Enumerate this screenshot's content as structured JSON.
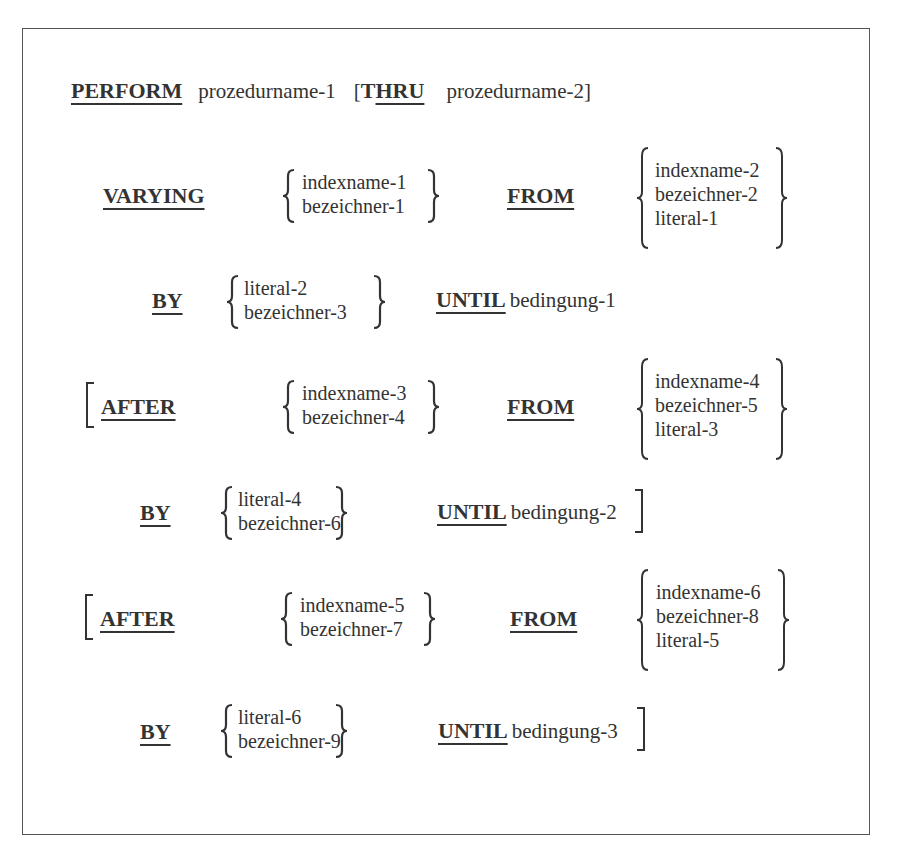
{
  "document": {
    "title": "COBOL PERFORM VARYING syntax format",
    "line1": {
      "keyword": "PERFORM",
      "operand1": "prozedurname-1",
      "open_bracket": "[",
      "thru_prefix": "T",
      "thru_keyword": "HRU",
      "operand2": "prozedurname-2]"
    },
    "varying_clause": {
      "keyword": "VARYING",
      "choices": [
        "indexname-1",
        "bezeichner-1"
      ],
      "from_keyword": "FROM",
      "from_choices": [
        "indexname-2",
        "bezeichner-2",
        "literal-1"
      ],
      "by_keyword": "BY",
      "by_choices": [
        "literal-2",
        "bezeichner-3"
      ],
      "until_keyword": "UNTIL",
      "condition": "bedingung-1"
    },
    "after_clauses": [
      {
        "keyword": "AFTER",
        "choices": [
          "indexname-3",
          "bezeichner-4"
        ],
        "from_keyword": "FROM",
        "from_choices": [
          "indexname-4",
          "bezeichner-5",
          "literal-3"
        ],
        "by_keyword": "BY",
        "by_choices": [
          "literal-4",
          "bezeichner-6"
        ],
        "until_keyword": "UNTIL",
        "condition": "bedingung-2"
      },
      {
        "keyword": "AFTER",
        "choices": [
          "indexname-5",
          "bezeichner-7"
        ],
        "from_keyword": "FROM",
        "from_choices": [
          "indexname-6",
          "bezeichner-8",
          "literal-5"
        ],
        "by_keyword": "BY",
        "by_choices": [
          "literal-6",
          "bezeichner-9"
        ],
        "until_keyword": "UNTIL",
        "condition": "bedingung-3"
      }
    ]
  }
}
